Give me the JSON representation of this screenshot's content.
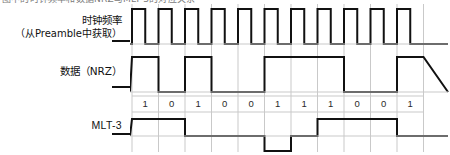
{
  "figure": {
    "top_caption_fragment": "图中的时钟频率和数据NRZ与MLT-3的对应关系",
    "colors": {
      "waveform": "#111111",
      "grid": "#c9c9c9",
      "background": "#ffffff",
      "text": "#111111"
    }
  },
  "rows": {
    "clock": {
      "label": "时钟频率",
      "sublabel": "（从Preamble中获取）"
    },
    "data": {
      "label": "数据（NRZ）"
    },
    "bits": {
      "label": "bit-sequence"
    },
    "mlt3": {
      "label": "MLT-3"
    }
  },
  "chart_data": {
    "type": "line",
    "xlabel": "",
    "ylabel": "",
    "bit_count": 11,
    "categories": [
      "1",
      "2",
      "3",
      "4",
      "5",
      "6",
      "7",
      "8",
      "9",
      "10",
      "11"
    ],
    "bits": [
      1,
      0,
      1,
      0,
      0,
      1,
      1,
      1,
      0,
      0,
      1
    ],
    "grid": true,
    "legend_position": "left",
    "series": [
      {
        "name": "时钟频率",
        "type": "square-clock",
        "levels": [
          1,
          0,
          1,
          0,
          1,
          0,
          1,
          0,
          1,
          0,
          1,
          0,
          1,
          0,
          1,
          0,
          1,
          0,
          1,
          0,
          1,
          0
        ],
        "description": "每个比特周期前半段为高电平，后半段为低电平，共 11 个时钟脉冲",
        "ylim": [
          0,
          1
        ]
      },
      {
        "name": "数据（NRZ）",
        "type": "nrz",
        "values": [
          1,
          0,
          1,
          0,
          0,
          1,
          1,
          1,
          0,
          0,
          1
        ],
        "description": "比特为 1 时为高电平，比特为 0 时为低电平",
        "ylim": [
          0,
          1
        ]
      },
      {
        "name": "MLT-3",
        "type": "mlt3",
        "values": [
          1,
          1,
          0,
          0,
          0,
          -1,
          0,
          1,
          1,
          1,
          0
        ],
        "description": "三电平编码：遇到比特 1 则按 0→+→0→-→0 循环跳变，遇到比特 0 则电平保持不变",
        "ylim": [
          -1,
          1
        ],
        "levels": [
          "+",
          "0",
          "-"
        ]
      }
    ]
  }
}
